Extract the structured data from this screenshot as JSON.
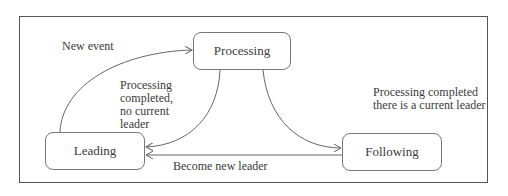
{
  "diagram": {
    "type": "state-machine",
    "states": [
      {
        "id": "processing",
        "label": "Processing"
      },
      {
        "id": "leading",
        "label": "Leading"
      },
      {
        "id": "following",
        "label": "Following"
      }
    ],
    "transitions": [
      {
        "from": "leading",
        "to": "processing",
        "label": "New event"
      },
      {
        "from": "processing",
        "to": "leading",
        "label_lines": [
          "Processing",
          "completed,",
          "no current",
          "leader"
        ]
      },
      {
        "from": "processing",
        "to": "following",
        "label_lines": [
          "Processing completed",
          "there is a current leader"
        ]
      },
      {
        "from": "following",
        "to": "leading",
        "label": "Become new leader"
      }
    ]
  },
  "colors": {
    "border": "#555555",
    "state_border": "#777777",
    "text": "#3a3a3a",
    "edge": "#666666"
  }
}
